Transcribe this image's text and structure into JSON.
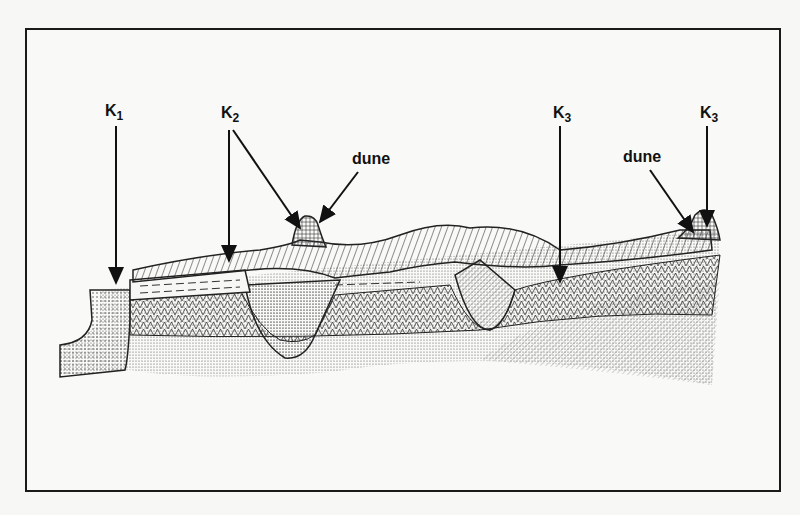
{
  "figure": {
    "type": "geological cross-section diagram",
    "labels": {
      "k1": {
        "main": "K",
        "sub": "1"
      },
      "k2": {
        "main": "K",
        "sub": "2"
      },
      "k3_left": {
        "main": "K",
        "sub": "3"
      },
      "k3_right": {
        "main": "K",
        "sub": "3"
      },
      "dune_left": "dune",
      "dune_right": "dune"
    },
    "colors": {
      "ink": "#111111",
      "frame": "#1a1a1a",
      "background": "#f7f7f5"
    }
  }
}
